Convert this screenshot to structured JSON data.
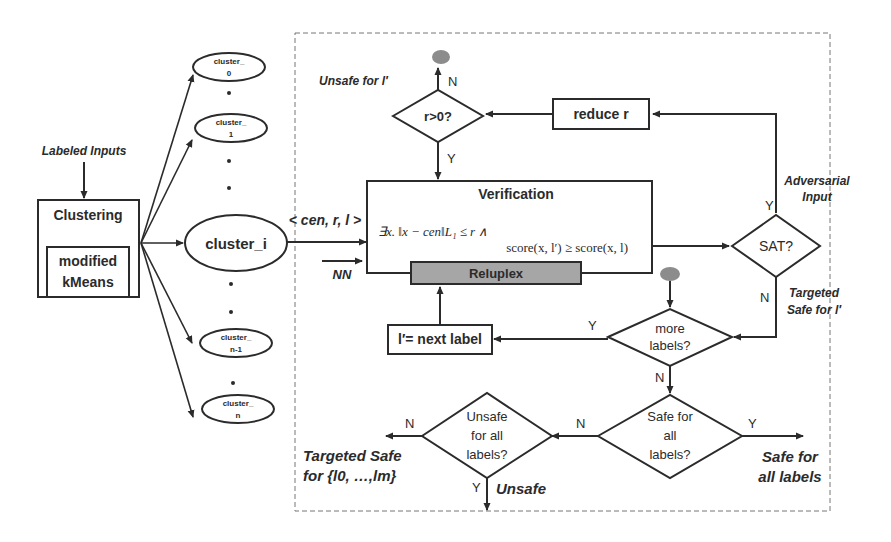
{
  "left": {
    "labeled_inputs": "Labeled Inputs",
    "clustering_title": "Clustering",
    "modified_line1": "modified",
    "modified_line2": "kMeans",
    "clusters": [
      {
        "line1": "cluster_",
        "line2": "0"
      },
      {
        "line1": "cluster_",
        "line2": "1"
      },
      {
        "line1": "cluster_i",
        "line2": ""
      },
      {
        "line1": "cluster_",
        "line2": "n-1"
      },
      {
        "line1": "cluster_",
        "line2": "n"
      }
    ],
    "tuple_label": "< cen, r, l >",
    "nn_label": "NN"
  },
  "verification": {
    "title": "Verification",
    "formula_line1": "∃x.   ‖x − cen‖L₁ ≤ r    ∧",
    "formula_line2": "score(x, l′) ≥ score(x, l)",
    "reluplex": "Reluplex"
  },
  "decisions": {
    "r_positive": "r>0?",
    "sat": "SAT?",
    "more_labels_1": "more",
    "more_labels_2": "labels?",
    "safe_all_1": "Safe for",
    "safe_all_2": "all",
    "safe_all_3": "labels?",
    "unsafe_all_1": "Unsafe",
    "unsafe_all_2": "for all",
    "unsafe_all_3": "labels?"
  },
  "processes": {
    "reduce_r": "reduce r",
    "next_label": "l′= next label"
  },
  "annotations": {
    "unsafe_for_l": "Unsafe for l′",
    "adversarial_1": "Adversarial",
    "adversarial_2": "Input",
    "targeted_safe_l_1": "Targeted",
    "targeted_safe_l_2": "Safe for l′",
    "targeted_safe_set_1": "Targeted Safe",
    "targeted_safe_set_2": "for {l0, …,lm}",
    "unsafe": "Unsafe",
    "safe_all_labels_1": "Safe for",
    "safe_all_labels_2": "all labels"
  },
  "edge_labels": {
    "yes": "Y",
    "no": "N"
  },
  "colors": {
    "stroke": "#2b2b2b",
    "reluplex_fill": "#a6a6a6",
    "terminal_fill": "#8c8c8c",
    "dashed": "#777777"
  }
}
